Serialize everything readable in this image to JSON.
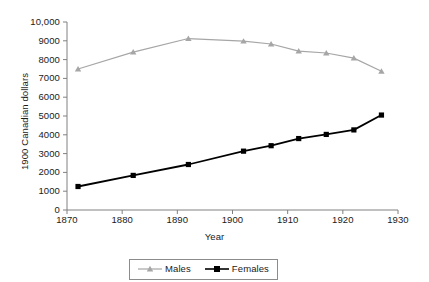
{
  "chart_data": {
    "type": "line",
    "title": "",
    "subtitle": "",
    "xlabel": "Year",
    "ylabel": "1900 Canadian dollars",
    "xlim": [
      1870,
      1930
    ],
    "ylim": [
      0,
      10000
    ],
    "xticks": [
      "1870",
      "1880",
      "1890",
      "1900",
      "1910",
      "1920",
      "1930"
    ],
    "xtick_values": [
      1870,
      1880,
      1890,
      1900,
      1910,
      1920,
      1930
    ],
    "yticks": [
      "0",
      "1000",
      "2000",
      "3000",
      "4000",
      "5000",
      "6000",
      "7000",
      "8000",
      "9000",
      "10,000"
    ],
    "ytick_values": [
      0,
      1000,
      2000,
      3000,
      4000,
      5000,
      6000,
      7000,
      8000,
      9000,
      10000
    ],
    "grid": false,
    "legend_position": "bottom-center",
    "x": [
      1872,
      1882,
      1892,
      1902,
      1907,
      1912,
      1917,
      1922,
      1927
    ],
    "series": [
      {
        "name": "Males",
        "color": "#a6a6a6",
        "marker": "triangle",
        "values": [
          7500,
          8400,
          9120,
          8980,
          8830,
          8450,
          8350,
          8080,
          7380
        ]
      },
      {
        "name": "Females",
        "color": "#000000",
        "marker": "square",
        "values": [
          1250,
          1840,
          2420,
          3130,
          3420,
          3800,
          4020,
          4260,
          5050
        ]
      }
    ]
  },
  "legend": {
    "items": [
      {
        "label": "Males"
      },
      {
        "label": "Females"
      }
    ]
  },
  "colors": {
    "males": "#a6a6a6",
    "females": "#000000",
    "axis": "#808080",
    "text": "#1a1a1a"
  }
}
